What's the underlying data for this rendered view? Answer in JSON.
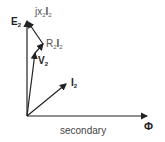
{
  "diagram": {
    "title": "secondary",
    "phasors": [
      {
        "name": "E",
        "sub": "2"
      },
      {
        "name": "V",
        "sub": "2"
      },
      {
        "name": "I",
        "sub": "2"
      },
      {
        "name": "Φ",
        "sub": ""
      }
    ],
    "drops": [
      {
        "prefix": "R",
        "sub": "2",
        "name": "I",
        "sub2": "2"
      },
      {
        "prefix": "jx",
        "sub": "2",
        "name": "I",
        "sub2": "2"
      }
    ]
  }
}
